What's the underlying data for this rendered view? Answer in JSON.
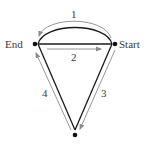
{
  "diagram": {
    "type": "route-diagram",
    "nodes": {
      "end": {
        "label": "End"
      },
      "start": {
        "label": "Start"
      },
      "bottom": {
        "label": ""
      }
    },
    "routes": [
      {
        "id": "1",
        "label": "1",
        "description": "curved arc path over the top from Start to End"
      },
      {
        "id": "2",
        "label": "2",
        "description": "straight path from End to Start"
      },
      {
        "id": "3",
        "label": "3",
        "description": "path from Start down to bottom vertex"
      },
      {
        "id": "4",
        "label": "4",
        "description": "path from bottom vertex up to End"
      }
    ],
    "colors": {
      "edge": "#1a1a1a",
      "arrow": "#8a8a8a",
      "text": "#3a3a3a",
      "background": "#ffffff"
    }
  }
}
